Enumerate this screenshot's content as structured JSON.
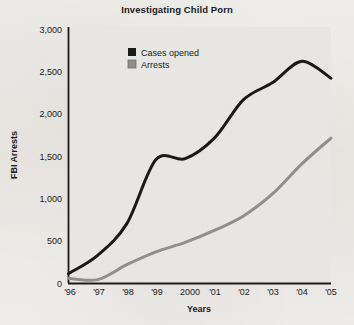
{
  "chart_data": {
    "type": "line",
    "title": "Investigating Child Porn",
    "xlabel": "Years",
    "ylabel": "FBI Arrests",
    "grid": false,
    "legend_position": "top-center",
    "x": [
      "'96",
      "'97",
      "'98",
      "'99",
      "2000",
      "'01",
      "'02",
      "'03",
      "'04",
      "'05"
    ],
    "xtick_labels": [
      "'96",
      "'97",
      "'98",
      "'99",
      "2000",
      "'01",
      "'02",
      "'03",
      "'04",
      "'05"
    ],
    "ytick_labels": [
      "0",
      "500",
      "1,000",
      "1,500",
      "2,000",
      "2,500",
      "3,000"
    ],
    "ytick_values": [
      0,
      500,
      1000,
      1500,
      2000,
      2500,
      3000
    ],
    "ylim": [
      0,
      3000
    ],
    "series": [
      {
        "name": "Cases opened",
        "color": "#1a1a1a",
        "values": [
          115,
          330,
          700,
          1450,
          1460,
          1700,
          2150,
          2350,
          2600,
          2400
        ]
      },
      {
        "name": "Arrests",
        "color": "#8f8f8f",
        "values": [
          60,
          45,
          220,
          370,
          480,
          620,
          790,
          1050,
          1400,
          1700
        ]
      }
    ]
  },
  "legend": {
    "items": [
      {
        "label": "Cases opened",
        "color": "#1a1a1a"
      },
      {
        "label": "Arrests",
        "color": "#8f8f8f"
      }
    ]
  },
  "colors": {
    "cases_opened": "#1a1a1a",
    "arrests": "#8f8f8f",
    "axis": "#1b1b1b",
    "plot_background": "#e8e6e2",
    "page_background": "#edebe8"
  }
}
